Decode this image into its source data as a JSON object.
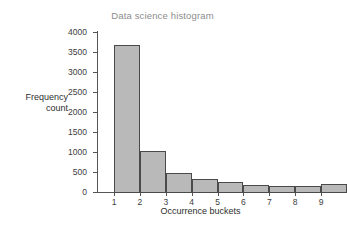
{
  "figure": {
    "background_color": "#ffffff",
    "title_color": "#8d8d8d",
    "bar_fill_color": "#b9b9b9",
    "bar_edge_color": "#4a4a4a",
    "axis_color": "#555555"
  },
  "chart_data": {
    "type": "bar",
    "title": "Data science histogram",
    "xlabel": "Occurrence buckets",
    "ylabel_line1": "Frequency",
    "ylabel_line2": "count",
    "categories": [
      "1",
      "2",
      "3",
      "4",
      "5",
      "6",
      "7",
      "8",
      "9"
    ],
    "values": [
      3680,
      1025,
      485,
      320,
      255,
      175,
      160,
      145,
      210
    ],
    "xtick_labels": [
      "1",
      "2",
      "3",
      "4",
      "5",
      "6",
      "7",
      "8",
      "9"
    ],
    "ytick_labels": [
      "0",
      "500",
      "1000",
      "1500",
      "2000",
      "2500",
      "3000",
      "3500",
      "4000"
    ],
    "ytick_values": [
      0,
      500,
      1000,
      1500,
      2000,
      2500,
      3000,
      3500,
      4000
    ],
    "ylim": [
      0,
      4000
    ],
    "xlim": [
      1,
      9
    ],
    "grid": false,
    "legend": false
  }
}
